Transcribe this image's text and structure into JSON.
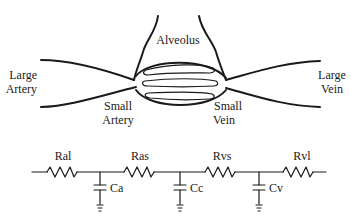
{
  "anatomy": {
    "labels": {
      "alveolus": "Alveolus",
      "large_artery": [
        "Large",
        "Artery"
      ],
      "small_artery": [
        "Small",
        "Artery"
      ],
      "small_vein": [
        "Small",
        "Vein"
      ],
      "large_vein": [
        "Large",
        "Vein"
      ]
    }
  },
  "circuit": {
    "resistors": [
      {
        "id": "Ral",
        "label": "Ral"
      },
      {
        "id": "Ras",
        "label": "Ras"
      },
      {
        "id": "Rvs",
        "label": "Rvs"
      },
      {
        "id": "Rvl",
        "label": "Rvl"
      }
    ],
    "capacitors": [
      {
        "id": "Ca",
        "label": "Ca"
      },
      {
        "id": "Cc",
        "label": "Cc"
      },
      {
        "id": "Cv",
        "label": "Cv"
      }
    ]
  }
}
